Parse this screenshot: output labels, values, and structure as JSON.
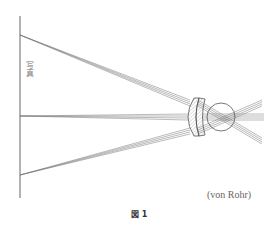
{
  "figure": {
    "caption": "図 1",
    "credit": "(von Rohr)",
    "vertical_label": "写真",
    "colors": {
      "line": "#555555",
      "ray": "#777777",
      "hatch": "#999999"
    }
  }
}
